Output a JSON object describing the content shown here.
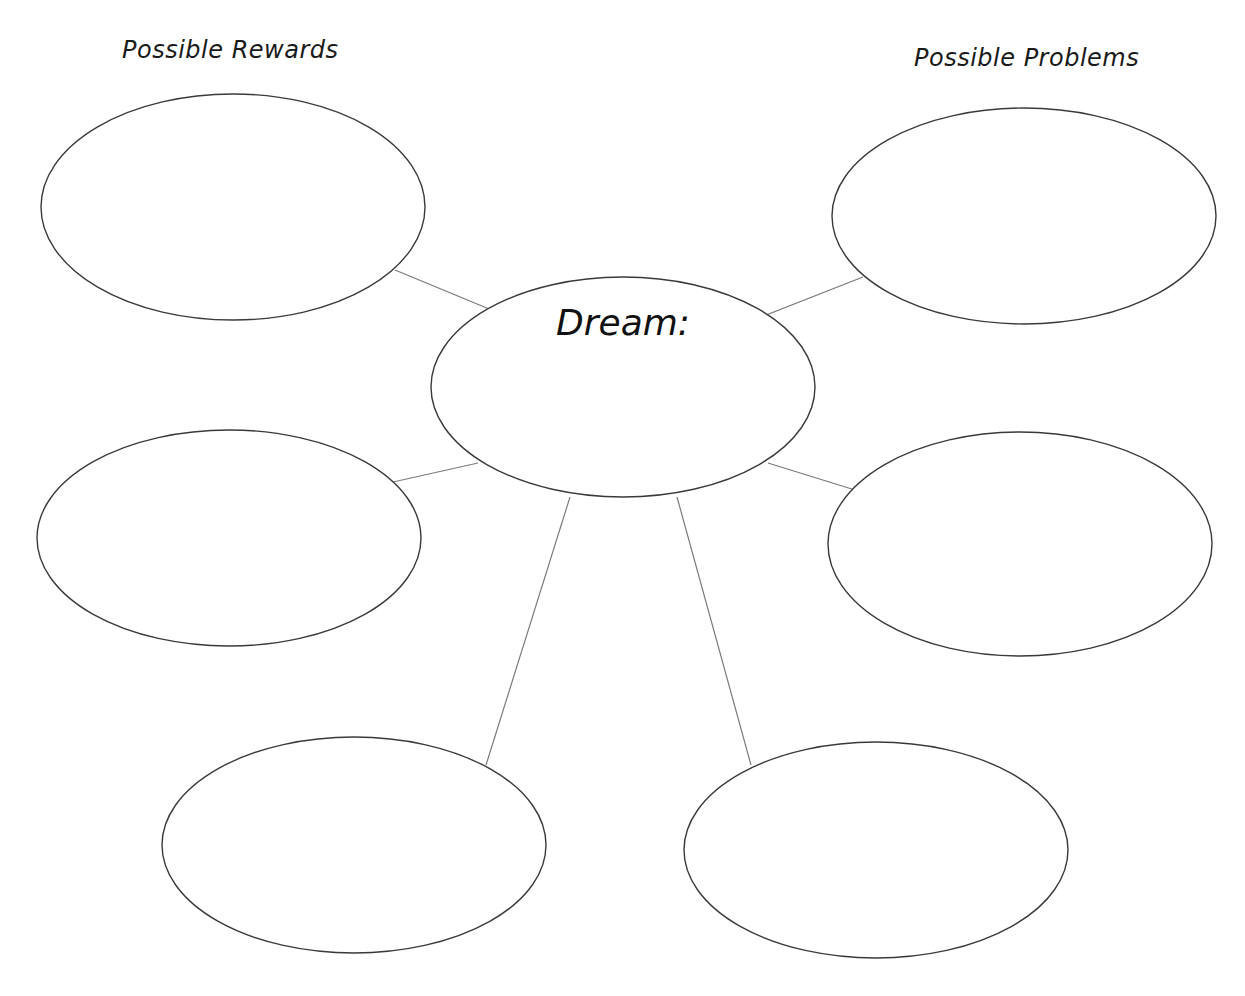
{
  "worksheet": {
    "left_heading": "Possible Rewards",
    "right_heading": "Possible Problems",
    "center_label": "Dream:"
  },
  "colors": {
    "ellipse_stroke": "#3a3a3a",
    "connector_stroke": "#7a7a7a",
    "text": "#1a1a1a",
    "background": "#ffffff"
  },
  "nodes": [
    {
      "id": "center",
      "label": "Dream:",
      "text": ""
    },
    {
      "id": "reward-1",
      "group": "Possible Rewards",
      "text": ""
    },
    {
      "id": "reward-2",
      "group": "Possible Rewards",
      "text": ""
    },
    {
      "id": "reward-3",
      "group": "Possible Rewards",
      "text": ""
    },
    {
      "id": "problem-1",
      "group": "Possible Problems",
      "text": ""
    },
    {
      "id": "problem-2",
      "group": "Possible Problems",
      "text": ""
    },
    {
      "id": "problem-3",
      "group": "Possible Problems",
      "text": ""
    }
  ]
}
